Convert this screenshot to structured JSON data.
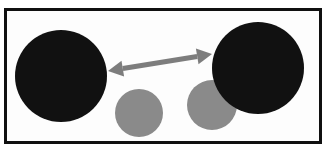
{
  "figure": {
    "title": "",
    "background_color": "#ffffff",
    "frame": {
      "border_color": "#101010",
      "border_width_px": 3,
      "fill_color": "#fdfdfd",
      "x": 4,
      "y": 8,
      "width": 318,
      "height": 136
    },
    "colors": {
      "dark_circle": "#111111",
      "light_circle": "#8a8a8a",
      "arrow": "#7d7d7d",
      "frame": "#101010",
      "background": "#ffffff"
    }
  },
  "shapes": [
    {
      "name": "large-dark-circle-left",
      "role": "primary-object",
      "color": "#111111",
      "cx": 61,
      "cy": 76,
      "r": 46,
      "z": 3
    },
    {
      "name": "large-dark-circle-right",
      "role": "primary-object",
      "color": "#111111",
      "cx": 258,
      "cy": 68,
      "r": 46,
      "z": 3
    },
    {
      "name": "small-gray-circle-center",
      "role": "secondary-object",
      "color": "#8a8a8a",
      "cx": 139,
      "cy": 113,
      "r": 24,
      "z": 1
    },
    {
      "name": "small-gray-circle-right",
      "role": "secondary-object",
      "color": "#8a8a8a",
      "cx": 212,
      "cy": 105,
      "r": 25,
      "z": 1
    }
  ],
  "arrow": {
    "name": "double-headed-distance-arrow",
    "label": "",
    "color": "#7d7d7d",
    "start_x": 108,
    "start_y": 71,
    "end_x": 212,
    "end_y": 54,
    "shaft_width_px": 5,
    "head_length_px": 15,
    "head_width_px": 16,
    "double_headed": true
  },
  "chart_data": {
    "type": "diagram",
    "title": "",
    "elements": [
      {
        "kind": "circle",
        "fill": "#111111",
        "cx": 61,
        "cy": 76,
        "r": 46
      },
      {
        "kind": "circle",
        "fill": "#8a8a8a",
        "cx": 139,
        "cy": 113,
        "r": 24
      },
      {
        "kind": "circle",
        "fill": "#8a8a8a",
        "cx": 212,
        "cy": 105,
        "r": 25
      },
      {
        "kind": "circle",
        "fill": "#111111",
        "cx": 258,
        "cy": 68,
        "r": 46
      },
      {
        "kind": "arrow",
        "fill": "#7d7d7d",
        "from": [
          108,
          71
        ],
        "to": [
          212,
          54
        ]
      }
    ]
  }
}
